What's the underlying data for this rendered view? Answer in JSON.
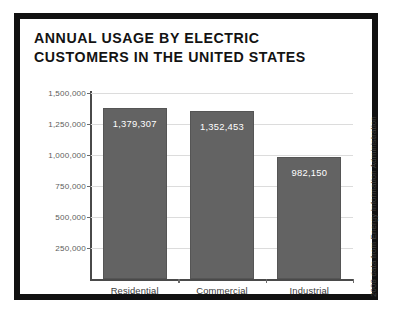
{
  "frame": {
    "border_color": "#111111",
    "background": "#ffffff"
  },
  "title": {
    "line1": "ANNUAL USAGE BY ELECTRIC",
    "line2": "CUSTOMERS IN THE UNITED STATES"
  },
  "source_note": "2008 data from Energy Information Administration",
  "chart_data": {
    "type": "bar",
    "title": "ANNUAL USAGE BY ELECTRIC CUSTOMERS IN THE UNITED STATES",
    "xlabel": "",
    "ylabel": "Millions of kWh",
    "categories": [
      "Residential",
      "Commercial",
      "Industrial"
    ],
    "values": [
      1379307,
      1352453,
      982150
    ],
    "value_labels": [
      "1,379,307",
      "1,352,453",
      "982,150"
    ],
    "ylim": [
      0,
      1500000
    ],
    "yticks": [
      250000,
      500000,
      750000,
      1000000,
      1250000,
      1500000
    ],
    "ytick_labels": [
      "250,000",
      "500,000",
      "750,000",
      "1,000,000",
      "1,250,000",
      "1,500,000"
    ],
    "grid": true,
    "legend": false,
    "bar_color": "#636363",
    "gridline_color": "#dcdcdc",
    "axis_color": "#4a4a4a",
    "value_label_color": "#ffffff"
  }
}
